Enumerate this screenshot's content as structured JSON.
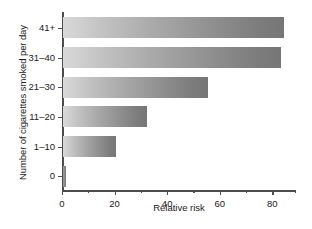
{
  "chart_data": {
    "type": "bar",
    "orientation": "horizontal",
    "title": "",
    "xlabel": "Relative risk",
    "ylabel": "Number of cigarettes smoked per day",
    "categories": [
      "0",
      "1–10",
      "11–20",
      "21–30",
      "31–40",
      "41+"
    ],
    "values": [
      1,
      20,
      32,
      55,
      83,
      84
    ],
    "xlim": [
      0,
      89
    ],
    "xticks": [
      0,
      20,
      40,
      60,
      80
    ],
    "xtick_labels": [
      "0",
      "20",
      "40",
      "60",
      "80"
    ],
    "xminor_ticks": [
      10,
      30,
      50,
      70
    ],
    "grid": false,
    "legend": null,
    "bar_fill": "gray-gradient-light-to-dark",
    "axis_color": "#4d4d4d",
    "text_color": "#1a1a1a"
  },
  "axes": {
    "x_axis_label": "Relative risk",
    "y_axis_label": "Number of cigarettes smoked per day"
  },
  "bars": [
    {
      "category": "41+",
      "value": 84
    },
    {
      "category": "31–40",
      "value": 83
    },
    {
      "category": "21–30",
      "value": 55
    },
    {
      "category": "11–20",
      "value": 32
    },
    {
      "category": "1–10",
      "value": 20
    },
    {
      "category": "0",
      "value": 1
    }
  ],
  "xticks": [
    {
      "label": "0",
      "value": 0
    },
    {
      "label": "20",
      "value": 20
    },
    {
      "label": "40",
      "value": 40
    },
    {
      "label": "60",
      "value": 60
    },
    {
      "label": "80",
      "value": 80
    }
  ]
}
